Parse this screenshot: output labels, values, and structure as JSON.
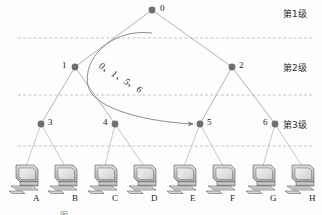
{
  "figure": {
    "type": "hierarchical-tree-network-diagram",
    "caption": "图",
    "arrow_annotation": "0、1、5、6",
    "level_labels": [
      {
        "text": "第1级",
        "x": 283,
        "y": 8
      },
      {
        "text": "第2级",
        "x": 283,
        "y": 62
      },
      {
        "text": "第3级",
        "x": 283,
        "y": 119
      }
    ],
    "dashed_separators_y": [
      38,
      95,
      146
    ],
    "nodes": [
      {
        "id": "0",
        "label": "0",
        "x": 152,
        "y": 10,
        "label_dx": 8,
        "label_dy": -6,
        "level": 1
      },
      {
        "id": "1",
        "label": "1",
        "x": 75,
        "y": 67,
        "label_dx": -13,
        "label_dy": -6,
        "level": 2
      },
      {
        "id": "2",
        "label": "2",
        "x": 232,
        "y": 67,
        "label_dx": 7,
        "label_dy": -6,
        "level": 2
      },
      {
        "id": "3",
        "label": "3",
        "x": 41,
        "y": 124,
        "label_dx": 7,
        "label_dy": -6,
        "level": 3
      },
      {
        "id": "4",
        "label": "4",
        "x": 115,
        "y": 124,
        "label_dx": -12,
        "label_dy": -6,
        "level": 3
      },
      {
        "id": "5",
        "label": "5",
        "x": 200,
        "y": 124,
        "label_dx": 7,
        "label_dy": -6,
        "level": 3
      },
      {
        "id": "6",
        "label": "6",
        "x": 275,
        "y": 124,
        "label_dx": -12,
        "label_dy": -6,
        "level": 3
      }
    ],
    "edges": [
      {
        "from": "0",
        "to": "1"
      },
      {
        "from": "0",
        "to": "2"
      },
      {
        "from": "1",
        "to": "3"
      },
      {
        "from": "1",
        "to": "4"
      },
      {
        "from": "2",
        "to": "5"
      },
      {
        "from": "2",
        "to": "6"
      }
    ],
    "hosts": [
      {
        "label": "A",
        "x": 8,
        "y": 163,
        "label_x": 33,
        "label_y": 199,
        "parent": "3"
      },
      {
        "label": "B",
        "x": 47,
        "y": 163,
        "label_x": 72,
        "label_y": 199,
        "parent": "3"
      },
      {
        "label": "C",
        "x": 87,
        "y": 163,
        "label_x": 112,
        "label_y": 199,
        "parent": "4"
      },
      {
        "label": "D",
        "x": 126,
        "y": 163,
        "label_x": 151,
        "label_y": 199,
        "parent": "4"
      },
      {
        "label": "E",
        "x": 166,
        "y": 163,
        "label_x": 190,
        "label_y": 199,
        "parent": "5"
      },
      {
        "label": "F",
        "x": 205,
        "y": 163,
        "label_x": 230,
        "label_y": 199,
        "parent": "5"
      },
      {
        "label": "G",
        "x": 245,
        "y": 163,
        "label_x": 270,
        "label_y": 199,
        "parent": "6"
      },
      {
        "label": "H",
        "x": 284,
        "y": 163,
        "label_x": 309,
        "label_y": 199,
        "parent": "6"
      }
    ],
    "colors": {
      "node_fill": "#6e6e6e",
      "edge": "#9a9a9a",
      "dashed": "#a9a9c9",
      "arrow": "#7a7a7a",
      "monitor_light": "#e9e9e9",
      "monitor_mid": "#c3c3c3",
      "monitor_dark": "#8e8e8e",
      "outline": "#5a5a5a"
    }
  }
}
